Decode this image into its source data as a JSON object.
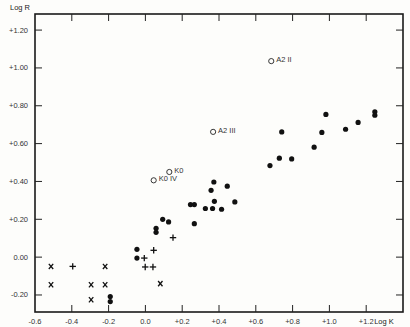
{
  "chart_data": {
    "type": "scatter",
    "title": "",
    "xlabel": "Log K",
    "ylabel": "Log R",
    "xlim": [
      -0.6,
      1.4
    ],
    "ylim": [
      -0.29,
      1.285
    ],
    "grid": false,
    "x_ticks": [
      {
        "value": -0.6,
        "label": "-0.6"
      },
      {
        "value": -0.4,
        "label": "-0.4"
      },
      {
        "value": -0.2,
        "label": "-0.2"
      },
      {
        "value": 0.0,
        "label": "0.0"
      },
      {
        "value": 0.2,
        "label": "+0.2"
      },
      {
        "value": 0.4,
        "label": "+0.4"
      },
      {
        "value": 0.6,
        "label": "+0.6"
      },
      {
        "value": 0.8,
        "label": "+0.8"
      },
      {
        "value": 1.0,
        "label": "+1.0"
      },
      {
        "value": 1.2,
        "label": "+1.2"
      }
    ],
    "y_ticks": [
      {
        "value": 1.2,
        "label": "+1.20"
      },
      {
        "value": 1.0,
        "label": "+1.00"
      },
      {
        "value": 0.8,
        "label": "+0.80"
      },
      {
        "value": 0.6,
        "label": "+0.60"
      },
      {
        "value": 0.4,
        "label": "+0.40"
      },
      {
        "value": 0.2,
        "label": "+0.20"
      },
      {
        "value": 0.0,
        "label": "0.00"
      },
      {
        "value": -0.2,
        "label": "-0.20"
      }
    ],
    "series": [
      {
        "name": "filled-dots",
        "marker": "dot",
        "points": [
          [
            -0.191,
            -0.208
          ],
          [
            -0.191,
            -0.235
          ],
          [
            -0.046,
            0.041
          ],
          [
            -0.046,
            -0.005
          ],
          [
            0.058,
            0.152
          ],
          [
            0.058,
            0.131
          ],
          [
            0.094,
            0.2
          ],
          [
            0.126,
            0.186
          ],
          [
            0.245,
            0.278
          ],
          [
            0.266,
            0.278
          ],
          [
            0.266,
            0.177
          ],
          [
            0.326,
            0.257
          ],
          [
            0.365,
            0.257
          ],
          [
            0.414,
            0.253
          ],
          [
            0.375,
            0.295
          ],
          [
            0.486,
            0.292
          ],
          [
            0.357,
            0.353
          ],
          [
            0.372,
            0.397
          ],
          [
            0.445,
            0.375
          ],
          [
            0.677,
            0.484
          ],
          [
            0.728,
            0.523
          ],
          [
            0.795,
            0.519
          ],
          [
            0.741,
            0.662
          ],
          [
            0.917,
            0.581
          ],
          [
            0.959,
            0.659
          ],
          [
            0.981,
            0.754
          ],
          [
            1.088,
            0.676
          ],
          [
            1.156,
            0.712
          ],
          [
            1.247,
            0.768
          ],
          [
            1.247,
            0.75
          ]
        ]
      },
      {
        "name": "plus-marks",
        "marker": "plus",
        "points": [
          [
            -0.395,
            -0.049
          ],
          [
            -0.006,
            -0.005
          ],
          [
            0.045,
            0.036
          ],
          [
            -0.001,
            -0.052
          ],
          [
            0.041,
            -0.052
          ],
          [
            0.15,
            0.103
          ]
        ]
      },
      {
        "name": "x-marks",
        "marker": "x",
        "points": [
          [
            -0.513,
            -0.049
          ],
          [
            -0.219,
            -0.049
          ],
          [
            -0.513,
            -0.146
          ],
          [
            -0.295,
            -0.146
          ],
          [
            -0.219,
            -0.146
          ],
          [
            -0.295,
            -0.225
          ],
          [
            0.081,
            -0.14
          ]
        ]
      },
      {
        "name": "labeled-open-circles",
        "marker": "open-circle",
        "points": [
          {
            "x": 0.684,
            "y": 1.036,
            "label": "A2 II"
          },
          {
            "x": 0.368,
            "y": 0.662,
            "label": "A2 III"
          },
          {
            "x": 0.13,
            "y": 0.45,
            "label": "K0"
          },
          {
            "x": 0.045,
            "y": 0.406,
            "label": "K0 IV"
          }
        ]
      }
    ]
  }
}
